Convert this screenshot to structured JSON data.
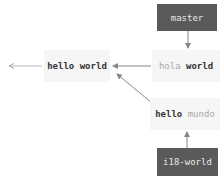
{
  "diagram": {
    "type": "git-branch-diagram",
    "colors": {
      "ref_bg": "#5a5a5a",
      "ref_text": "#e8e8e8",
      "commit_bg": "#f6f6f6",
      "arrow": "#888888"
    },
    "refs": {
      "master": "master",
      "i18": "i18-world"
    },
    "commits": {
      "base": {
        "word1": "hello",
        "word2": "world"
      },
      "hola": {
        "word1": "hola",
        "word2": "world"
      },
      "mundo": {
        "word1": "hello",
        "word2": "mundo"
      }
    },
    "edges": [
      {
        "from": "master",
        "to": "hola world"
      },
      {
        "from": "hola world",
        "to": "hello world"
      },
      {
        "from": "hello mundo",
        "to": "hello world"
      },
      {
        "from": "i18-world",
        "to": "hello mundo"
      },
      {
        "from": "hello world",
        "to": "previous (off-screen)"
      }
    ]
  }
}
